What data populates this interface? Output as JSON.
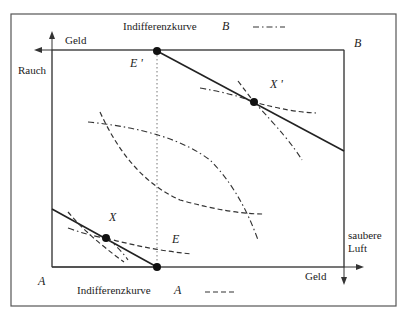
{
  "diagram": {
    "type": "edgeworth-box",
    "legend_top": {
      "label": "Indifferenzkurve",
      "agent": "B",
      "line_style": "dash-dot"
    },
    "legend_bottom": {
      "label": "Indifferenzkurve",
      "agent": "A",
      "line_style": "dashed"
    },
    "origin_A": "A",
    "origin_B": "B",
    "axes": {
      "A_x": "Geld",
      "A_y": "saubere Luft",
      "A_y_line1": "saubere",
      "A_y_line2": "Luft",
      "B_x": "Geld",
      "B_y": "Rauch"
    },
    "points": [
      {
        "id": "E",
        "label": "E"
      },
      {
        "id": "E_prime",
        "label": "E '"
      },
      {
        "id": "X",
        "label": "X"
      },
      {
        "id": "X_prime",
        "label": "X '"
      }
    ],
    "colors": {
      "line": "#222222",
      "frame": "#555555",
      "dotted": "#777777"
    }
  }
}
